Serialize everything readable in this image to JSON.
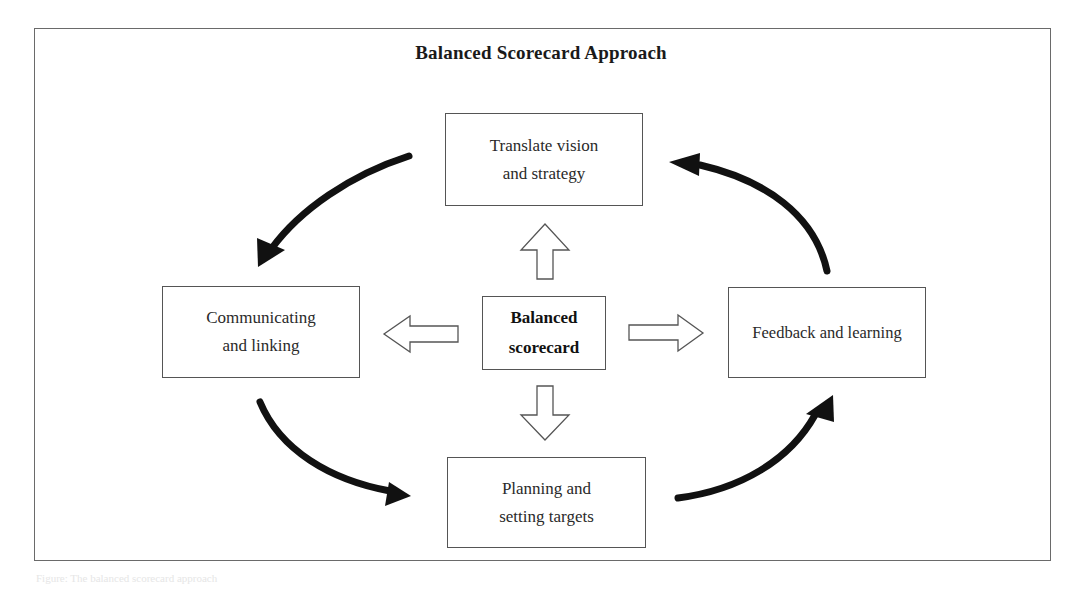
{
  "diagram": {
    "title": "Balanced Scorecard Approach",
    "center": {
      "line1": "Balanced",
      "line2": "scorecard"
    },
    "nodes": [
      {
        "id": "translate",
        "line1": "Translate vision",
        "line2": "and strategy"
      },
      {
        "id": "communicating",
        "line1": "Communicating",
        "line2": "and linking"
      },
      {
        "id": "feedback",
        "line1": "Feedback and learning",
        "line2": ""
      },
      {
        "id": "planning",
        "line1": "Planning and",
        "line2": "setting targets"
      }
    ],
    "hollow_arrows": [
      "center-to-translate",
      "center-to-communicating",
      "center-to-feedback",
      "center-to-planning"
    ],
    "cycle_arrows": [
      "translate-to-communicating",
      "communicating-to-planning",
      "planning-to-feedback",
      "feedback-to-translate"
    ],
    "colors": {
      "frame": "#6a6a6a",
      "box_border": "#555555",
      "arrow_fill": "#111111",
      "text": "#222222"
    }
  },
  "caption": "Figure: The balanced scorecard approach"
}
